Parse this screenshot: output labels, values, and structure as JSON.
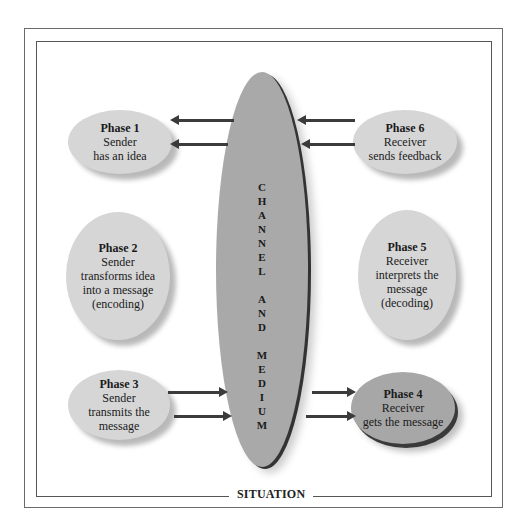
{
  "diagram": {
    "frame_label": "SITUATION",
    "channel": {
      "letters": [
        "C",
        "H",
        "A",
        "N",
        "N",
        "E",
        "L",
        "",
        "A",
        "N",
        "D",
        "",
        "M",
        "E",
        "D",
        "I",
        "U",
        "M"
      ],
      "label": "CHANNEL AND MEDIUM"
    },
    "phases": [
      {
        "title": "Phase 1",
        "desc": "Sender\nhas an idea"
      },
      {
        "title": "Phase 2",
        "desc": "Sender\ntransforms idea\ninto a message\n(encoding)"
      },
      {
        "title": "Phase 3",
        "desc": "Sender\ntransmits the\nmessage"
      },
      {
        "title": "Phase 4",
        "desc": "Receiver\ngets the message"
      },
      {
        "title": "Phase 5",
        "desc": "Receiver\ninterprets the\nmessage\n(decoding)"
      },
      {
        "title": "Phase 6",
        "desc": "Receiver\nsends feedback"
      }
    ],
    "colors": {
      "phase_fill": "#d6d6d6",
      "phase4_fill": "#a7a7a7",
      "channel_fill": "#a9a9a9",
      "arrow": "#3b3b3b"
    }
  }
}
